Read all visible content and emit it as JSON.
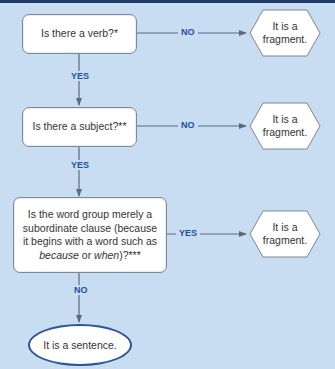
{
  "flowchart": {
    "questions": [
      {
        "text": "Is there a verb?*"
      },
      {
        "text": "Is there a subject?**"
      },
      {
        "lines": [
          "Is the word group merely a",
          "subordinate clause (because",
          "it begins with a word such as"
        ],
        "italic_1": "because",
        "mid": " or ",
        "italic_2": "when",
        "tail": ")?***"
      }
    ],
    "outcomes": [
      {
        "line1": "It is a",
        "line2": "fragment."
      },
      {
        "line1": "It is a",
        "line2": "fragment."
      },
      {
        "line1": "It is a",
        "line2": "fragment."
      }
    ],
    "branch_labels": {
      "q1_right": "NO",
      "q1_down": "YES",
      "q2_right": "NO",
      "q2_down": "YES",
      "q3_right": "YES",
      "q3_down": "NO"
    },
    "final": "It is a sentence."
  },
  "colors": {
    "background": "#c8dcf2",
    "label": "#1f4fa3",
    "connector": "#5b6b7e",
    "ellipse_border": "#2a5599"
  }
}
